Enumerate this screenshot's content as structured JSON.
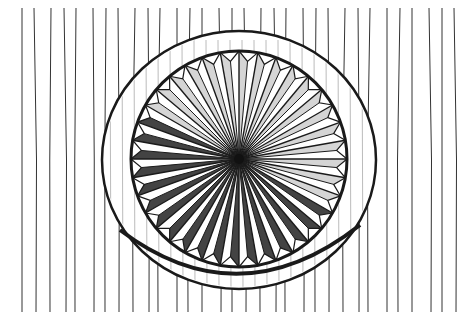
{
  "image": {
    "subject": "chip-carved circular rosette on wood grain",
    "style": "black pen-and-ink illustration",
    "colors": {
      "ink": "#1a1a1a",
      "paper": "#ffffff"
    },
    "rosette": {
      "center": [
        239,
        159
      ],
      "outer_rx": 137,
      "outer_ry": 128,
      "inner_r": 108,
      "segments": 36
    }
  }
}
